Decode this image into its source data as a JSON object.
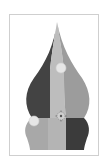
{
  "canvas": {
    "frame": {
      "border_color": "#cfcfcf",
      "background": "#ffffff"
    },
    "shape": {
      "name": "onion-dome",
      "colors": {
        "dark": "#434343",
        "medium": "#9c9c9c",
        "light": "#bdbdbd",
        "lower_left": "#a8a8a8",
        "lower_center": "#b4b4b4",
        "lower_right": "#3b3b3b"
      }
    },
    "handles": [
      {
        "name": "control-point-upper",
        "x": 61,
        "y": 68,
        "r": 5,
        "color": "#e6e6e6"
      },
      {
        "name": "control-point-left",
        "x": 34,
        "y": 121,
        "r": 5,
        "color": "#e6e6e6"
      },
      {
        "name": "transform-center",
        "x": 61,
        "y": 116,
        "r": 4
      }
    ]
  }
}
